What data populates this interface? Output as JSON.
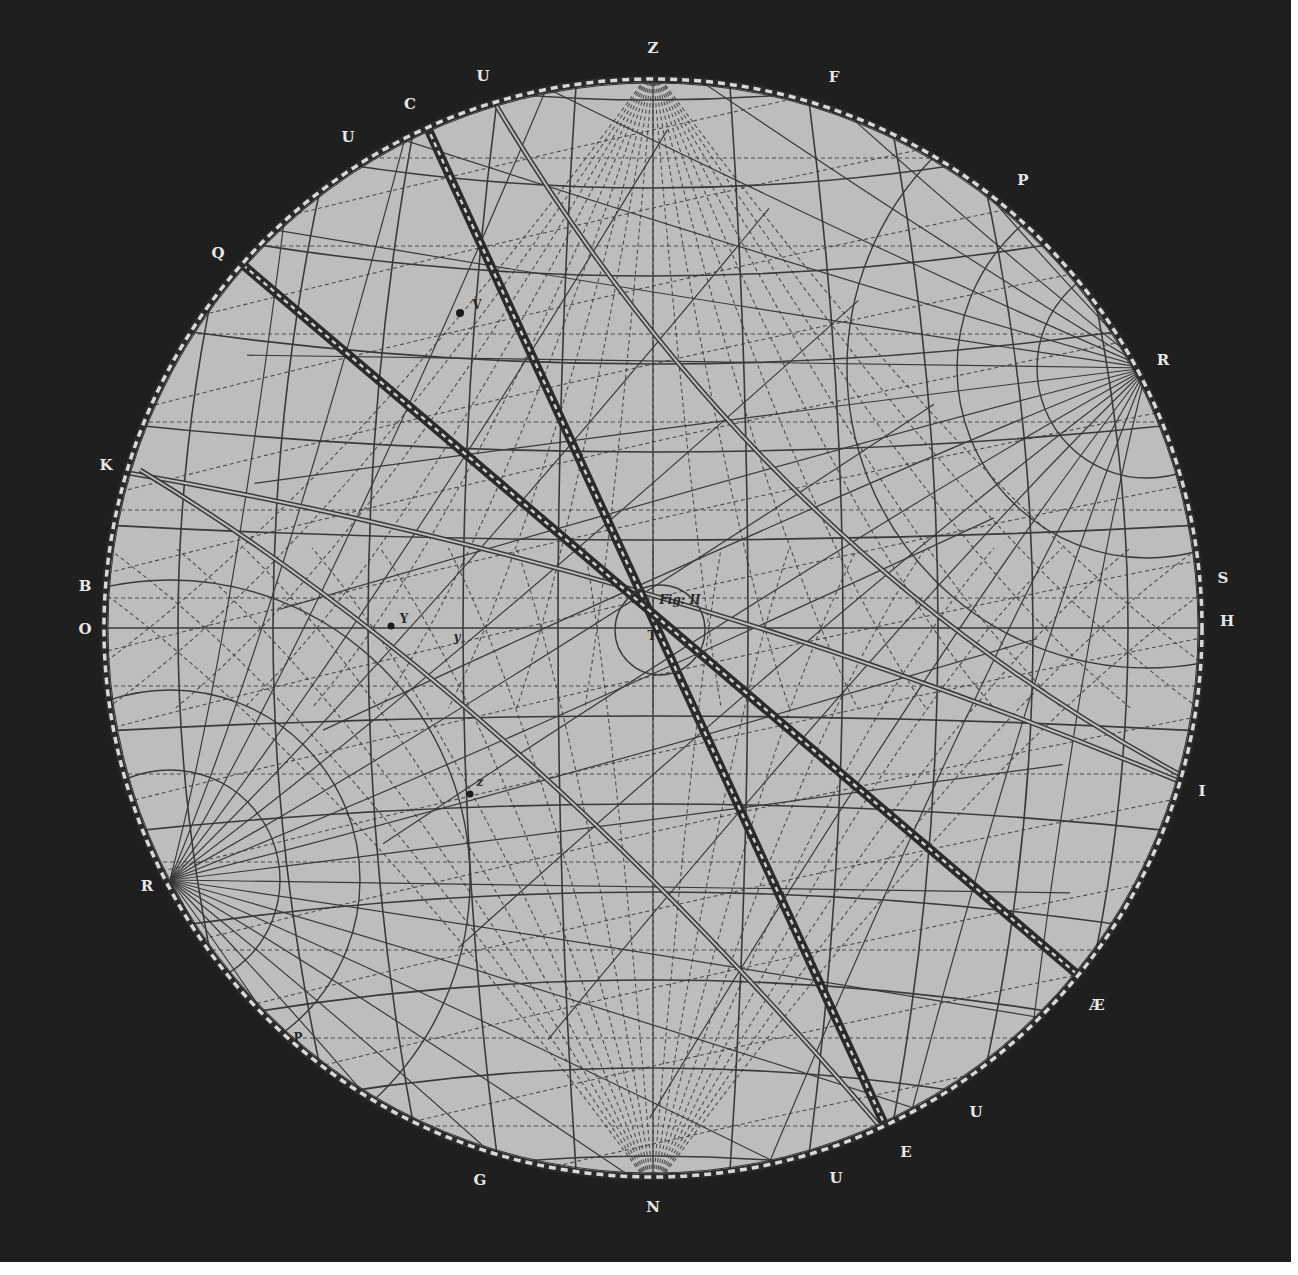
{
  "figure": {
    "title": "Fig: II",
    "colors": {
      "background": "#1f1f1f",
      "disc": "#bdbdbd",
      "ink": "#3a3a3a",
      "label": "#e8e8e8",
      "margin": "#ffffff"
    },
    "circle": {
      "cx": 653,
      "cy": 628,
      "r": 548
    },
    "center_label": "T"
  },
  "perimeter_labels": [
    {
      "id": "Z",
      "text": "Z",
      "x": 653,
      "y": 48
    },
    {
      "id": "U1",
      "text": "U",
      "x": 483,
      "y": 76
    },
    {
      "id": "C",
      "text": "C",
      "x": 410,
      "y": 104
    },
    {
      "id": "U2",
      "text": "U",
      "x": 348,
      "y": 137
    },
    {
      "id": "F",
      "text": "F",
      "x": 834,
      "y": 77
    },
    {
      "id": "P1",
      "text": "P",
      "x": 1023,
      "y": 180
    },
    {
      "id": "Q",
      "text": "Q",
      "x": 218,
      "y": 253
    },
    {
      "id": "R1",
      "text": "R",
      "x": 1163,
      "y": 360
    },
    {
      "id": "K",
      "text": "K",
      "x": 106,
      "y": 465
    },
    {
      "id": "B",
      "text": "B",
      "x": 85,
      "y": 586
    },
    {
      "id": "O",
      "text": "O",
      "x": 85,
      "y": 629
    },
    {
      "id": "S",
      "text": "S",
      "x": 1223,
      "y": 578
    },
    {
      "id": "H",
      "text": "H",
      "x": 1227,
      "y": 621
    },
    {
      "id": "I",
      "text": "I",
      "x": 1202,
      "y": 791
    },
    {
      "id": "R2",
      "text": "R",
      "x": 147,
      "y": 886
    },
    {
      "id": "AE",
      "text": "Æ",
      "x": 1097,
      "y": 1005
    },
    {
      "id": "U3",
      "text": "U",
      "x": 976,
      "y": 1112
    },
    {
      "id": "E",
      "text": "E",
      "x": 906,
      "y": 1152
    },
    {
      "id": "U4",
      "text": "U",
      "x": 836,
      "y": 1178
    },
    {
      "id": "G",
      "text": "G",
      "x": 480,
      "y": 1180
    },
    {
      "id": "N",
      "text": "N",
      "x": 653,
      "y": 1207
    }
  ],
  "interior_labels": [
    {
      "id": "fig",
      "text": "Fig: II",
      "x": 680,
      "y": 600,
      "italic": true
    },
    {
      "id": "T",
      "text": "T",
      "x": 652,
      "y": 636,
      "italic": false
    },
    {
      "id": "V",
      "text": "V",
      "x": 477,
      "y": 305,
      "italic": false
    },
    {
      "id": "Y",
      "text": "Y",
      "x": 404,
      "y": 619,
      "italic": false
    },
    {
      "id": "y",
      "text": "y",
      "x": 457,
      "y": 637,
      "italic": true
    },
    {
      "id": "z",
      "text": "z",
      "x": 480,
      "y": 782,
      "italic": true
    },
    {
      "id": "P2",
      "text": "P",
      "x": 298,
      "y": 1038,
      "italic": false
    }
  ],
  "stars": [
    {
      "id": "star-v",
      "x": 460,
      "y": 313,
      "r": 4
    },
    {
      "id": "star-y",
      "x": 391,
      "y": 626,
      "r": 3.5
    },
    {
      "id": "star-z",
      "x": 470,
      "y": 794,
      "r": 3.5
    }
  ],
  "poles": [
    {
      "id": "pole-upper-right",
      "x": 1147,
      "y": 368
    },
    {
      "id": "pole-lower-left",
      "x": 170,
      "y": 880
    },
    {
      "id": "zenith",
      "x": 653,
      "y": 68
    },
    {
      "id": "nadir",
      "x": 653,
      "y": 1190
    }
  ],
  "bands": [
    {
      "id": "band-C-E",
      "x1": 423,
      "y1": 118,
      "x2": 893,
      "y2": 1143
    },
    {
      "id": "band-Q-AE",
      "x1": 236,
      "y1": 259,
      "x2": 1078,
      "y2": 975
    }
  ]
}
